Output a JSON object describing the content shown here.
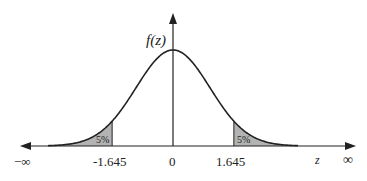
{
  "diagram": {
    "y_axis_label": "f(z)",
    "x_axis_label": "z",
    "x_ticks": [
      {
        "label": "−∞",
        "value": "-inf"
      },
      {
        "label": "-1.645",
        "value": -1.645
      },
      {
        "label": "0",
        "value": 0
      },
      {
        "label": "1.645",
        "value": 1.645
      },
      {
        "label": "∞",
        "value": "inf"
      }
    ],
    "regions": [
      {
        "side": "left",
        "label": "5%",
        "bound": -1.645
      },
      {
        "side": "right",
        "label": "5%",
        "bound": 1.645
      }
    ],
    "colors": {
      "curve": "#222222",
      "axis": "#222222",
      "shade": "#b3b3b3"
    }
  }
}
